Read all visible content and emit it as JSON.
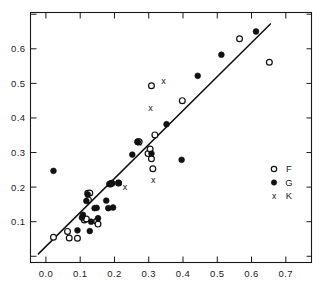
{
  "chart_data": {
    "type": "scatter",
    "title": "",
    "xlabel": "",
    "ylabel": "",
    "xlim": [
      -0.045,
      0.775
    ],
    "ylim": [
      -0.018,
      0.705
    ],
    "grid": false,
    "legend_position": "right-middle",
    "xticks": [
      0.0,
      0.1,
      0.2,
      0.3,
      0.4,
      0.5,
      0.6,
      0.7
    ],
    "xtick_labels": [
      "0.0",
      "0.1",
      "0.2",
      "0.3",
      "0.4",
      "0.5",
      "0.6",
      "0.7"
    ],
    "yticks": [
      0.1,
      0.2,
      0.3,
      0.4,
      0.5,
      0.6
    ],
    "ytick_labels": [
      "0.1",
      "0.2",
      "0.3",
      "0.4",
      "0.5",
      "0.6"
    ],
    "ytick_minor": [
      0.0,
      0.7
    ],
    "reference_line": {
      "label": "",
      "x0": -0.022,
      "y0": 0.007,
      "x1": 0.655,
      "y1": 0.672
    },
    "series": [
      {
        "name": "F",
        "marker": "open-circle",
        "points": [
          [
            0.022,
            0.055
          ],
          [
            0.063,
            0.072
          ],
          [
            0.068,
            0.053
          ],
          [
            0.092,
            0.052
          ],
          [
            0.112,
            0.105
          ],
          [
            0.118,
            0.108
          ],
          [
            0.122,
            0.182
          ],
          [
            0.124,
            0.163
          ],
          [
            0.128,
            0.183
          ],
          [
            0.148,
            0.101
          ],
          [
            0.152,
            0.093
          ],
          [
            0.188,
            0.209
          ],
          [
            0.192,
            0.211
          ],
          [
            0.212,
            0.212
          ],
          [
            0.268,
            0.331
          ],
          [
            0.272,
            0.331
          ],
          [
            0.298,
            0.297
          ],
          [
            0.304,
            0.31
          ],
          [
            0.308,
            0.282
          ],
          [
            0.308,
            0.493
          ],
          [
            0.312,
            0.253
          ],
          [
            0.318,
            0.351
          ],
          [
            0.398,
            0.45
          ],
          [
            0.565,
            0.629
          ],
          [
            0.652,
            0.561
          ]
        ]
      },
      {
        "name": "G",
        "marker": "filled-circle",
        "points": [
          [
            0.022,
            0.247
          ],
          [
            0.092,
            0.075
          ],
          [
            0.105,
            0.112
          ],
          [
            0.108,
            0.12
          ],
          [
            0.118,
            0.16
          ],
          [
            0.122,
            0.179
          ],
          [
            0.128,
            0.073
          ],
          [
            0.132,
            0.1
          ],
          [
            0.142,
            0.139
          ],
          [
            0.148,
            0.14
          ],
          [
            0.152,
            0.11
          ],
          [
            0.176,
            0.161
          ],
          [
            0.182,
            0.139
          ],
          [
            0.185,
            0.209
          ],
          [
            0.192,
            0.211
          ],
          [
            0.196,
            0.141
          ],
          [
            0.212,
            0.212
          ],
          [
            0.252,
            0.294
          ],
          [
            0.268,
            0.331
          ],
          [
            0.308,
            0.297
          ],
          [
            0.352,
            0.382
          ],
          [
            0.396,
            0.279
          ],
          [
            0.443,
            0.522
          ],
          [
            0.512,
            0.583
          ],
          [
            0.613,
            0.65
          ]
        ]
      },
      {
        "name": "K",
        "marker": "cross-x",
        "points": [
          [
            0.231,
            0.201
          ],
          [
            0.272,
            0.329
          ],
          [
            0.305,
            0.428
          ],
          [
            0.313,
            0.221
          ],
          [
            0.343,
            0.508
          ]
        ]
      }
    ]
  },
  "legend": {
    "entries": [
      {
        "label": "F",
        "marker": "open-circle"
      },
      {
        "label": "G",
        "marker": "filled-circle"
      },
      {
        "label": "K",
        "marker": "cross-x"
      }
    ]
  }
}
